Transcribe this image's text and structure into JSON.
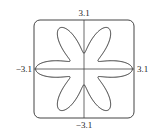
{
  "chart_data": {
    "type": "line",
    "subtype": "polar",
    "title": "",
    "equation": "r = 2 + cos(6θ)",
    "theta_range": [
      0,
      6.2832
    ],
    "xlim": [
      -3.1,
      3.1
    ],
    "ylim": [
      -3.1,
      3.1
    ],
    "xlabel": "",
    "ylabel": "",
    "tick_labels": {
      "top": "3.1",
      "bottom": "−3.1",
      "left": "−3.1",
      "right": "3.1"
    },
    "grid": false,
    "series": [
      {
        "name": "rose",
        "color": "#333333"
      }
    ]
  }
}
